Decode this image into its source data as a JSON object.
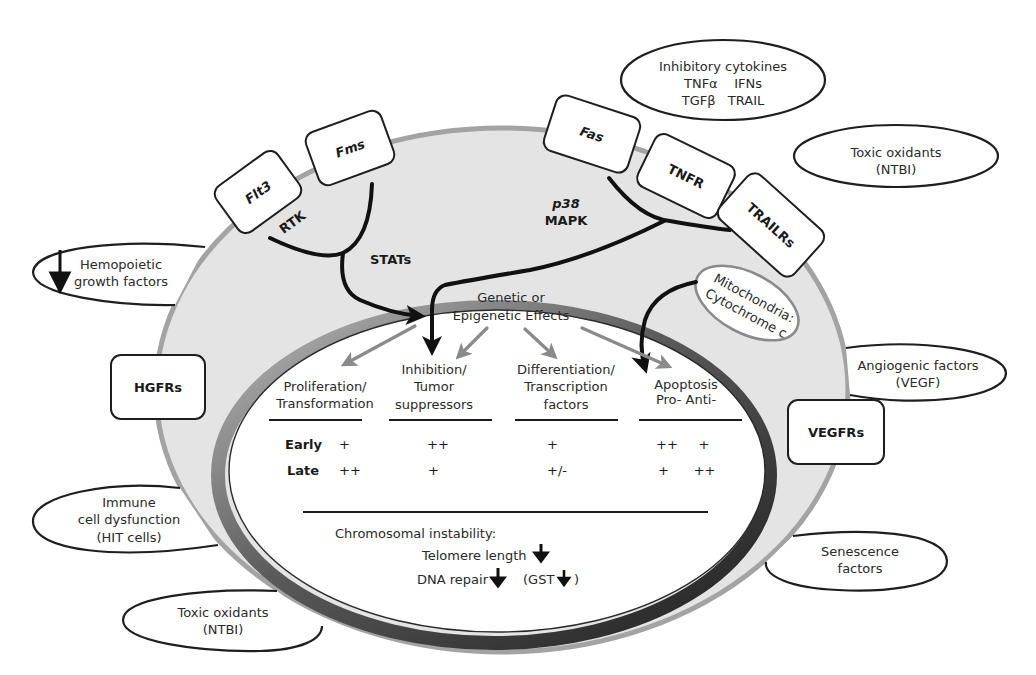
{
  "outside_factors": {
    "inhibitory_cytokines": {
      "lines": [
        "Inhibitory cytokines",
        "TNFα    IFNs",
        "TGFβ   TRAIL"
      ]
    },
    "toxic_oxidants_top": {
      "lines": [
        "Toxic oxidants",
        "(NTBI)"
      ]
    },
    "hemopoietic_growth_factors": {
      "lines": [
        "Hemopoietic",
        "growth factors"
      ],
      "arrow": "down"
    },
    "angiogenic_factors": {
      "lines": [
        "Angiogenic factors",
        "(VEGF)"
      ]
    },
    "immune_dysfunction": {
      "lines": [
        "Immune",
        "cell dysfunction",
        "(HIT cells)"
      ]
    },
    "toxic_oxidants_bottom": {
      "lines": [
        "Toxic oxidants",
        "(NTBI)"
      ]
    },
    "senescence_factors": {
      "lines": [
        "Senescence",
        "factors"
      ]
    }
  },
  "receptors": {
    "flt3": "Flt3",
    "fms": "Fms",
    "fas": "Fas",
    "tnfr": "TNFR",
    "trailrs": "TRAILRs",
    "hgfrs": "HGFRs",
    "vegfrs": "VEGFRs"
  },
  "pathways": {
    "rtk": "RTK",
    "stats": "STATs",
    "p38": "p38",
    "mapk": "MAPK"
  },
  "mitochondria": {
    "lines": [
      "Mitochondria:",
      "Cytochrome c"
    ]
  },
  "nucleus": {
    "center_label": [
      "Genetic or",
      "Epigenetic Effects"
    ],
    "columns": [
      {
        "lines": [
          "Proliferation/",
          "Transformation"
        ],
        "early": "+",
        "late": "++"
      },
      {
        "lines": [
          "Inhibition/",
          "Tumor",
          "suppressors"
        ],
        "early": "++",
        "late": "+"
      },
      {
        "lines": [
          "Differentiation/",
          "Transcription",
          "factors"
        ],
        "early": "+",
        "late": "+/-"
      },
      {
        "lines": [
          "Apoptosis",
          "Pro-   Anti-"
        ],
        "early": "++     +",
        "late": "+      ++"
      }
    ],
    "row_labels": {
      "early": "Early",
      "late": "Late"
    },
    "chromosomal": {
      "title": "Chromosomal instability:",
      "telomere": "Telomere length",
      "dna_repair": "DNA repair",
      "gst": "(GST",
      "gst_close": ")"
    }
  },
  "colors": {
    "cell_fill": "#e6e6e6",
    "cell_border": "#a0a0a0",
    "nucleus_rim": "#3a3a3a",
    "grey_arrow": "#8a8a8a",
    "black_arrow": "#111111"
  }
}
